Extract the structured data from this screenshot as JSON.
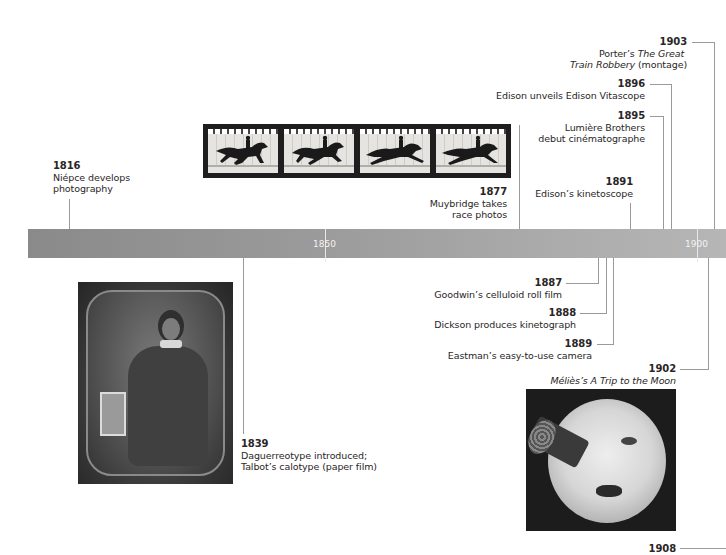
{
  "timeline": {
    "axis": {
      "bar_color_start": "#8a8a8a",
      "bar_color_end": "#b6b6b6",
      "connector_color": "#9a9a9a",
      "ticks": [
        {
          "label": "1850"
        },
        {
          "label": "1900"
        }
      ]
    },
    "events": [
      {
        "year": "1816",
        "text": "Niépce develops",
        "text2": "photography"
      },
      {
        "year": "1839",
        "text": "Daguerreotype introduced;",
        "text2": "Talbot’s calotype (paper film)"
      },
      {
        "year": "1877",
        "text": "Muybridge takes",
        "text2": "race photos"
      },
      {
        "year": "1887",
        "text": "Goodwin’s celluloid roll film"
      },
      {
        "year": "1888",
        "text": "Dickson produces kinetograph"
      },
      {
        "year": "1889",
        "text": "Eastman’s easy-to-use camera"
      },
      {
        "year": "1891",
        "text": "Edison’s kinetoscope"
      },
      {
        "year": "1895",
        "text": "Lumière Brothers",
        "text2": "debut cinématographe"
      },
      {
        "year": "1896",
        "text": "Edison unveils Edison Vitascope"
      },
      {
        "year": "1902",
        "text_prefix": "Méliès’s ",
        "text_italic": "A Trip to the Moon"
      },
      {
        "year": "1903",
        "text_prefix": "Porter’s ",
        "text_italic": "The Great",
        "text2_italic": "Train Robbery",
        "text2_suffix": " (montage)"
      },
      {
        "year": "1908"
      }
    ],
    "images": [
      {
        "name": "muybridge-horse-film-strip",
        "frames": 4
      },
      {
        "name": "daguerreotype-portrait"
      },
      {
        "name": "trip-to-the-moon-still"
      }
    ]
  }
}
